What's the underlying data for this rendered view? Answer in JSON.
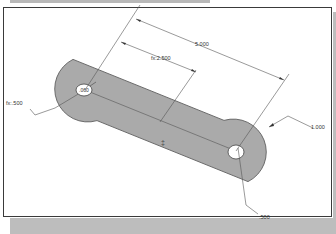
{
  "viewport": {
    "type": "CAD part drawing",
    "part": "slotted link",
    "colors": {
      "part_fill": "#aaaaaa",
      "part_edge": "#6a6a6a",
      "dimension_line": "#555555",
      "frame_border": "#3a3a3a",
      "shadow": "#bdbdbd",
      "background": "#ffffff"
    }
  },
  "dimensions": {
    "overall_length": "5.000",
    "half_length": "fx:2.500",
    "end_radius": "fx:.500",
    "width": "1.000",
    "hole_dia_left": ".060",
    "hole_dia_right": ".500"
  },
  "annotations": {
    "center_marker": "‡"
  }
}
